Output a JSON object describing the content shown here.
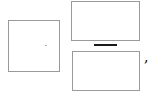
{
  "formula": {
    "left_slot": {
      "value": "",
      "placeholder": ""
    },
    "fraction": {
      "numerator": {
        "value": "",
        "placeholder": ""
      },
      "denominator": {
        "value": "",
        "placeholder": ""
      }
    },
    "trailing_punctuation": ","
  },
  "colors": {
    "slot_border": "#9a9a9a",
    "fraction_bar": "#1a1a1a"
  }
}
